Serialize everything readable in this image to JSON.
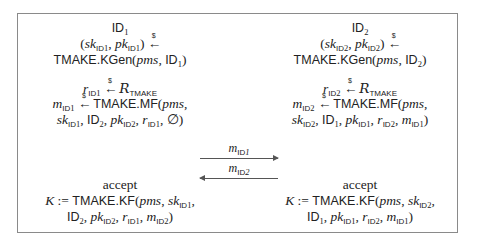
{
  "diagram": {
    "type": "protocol-flow",
    "parties": [
      {
        "id": "ID1",
        "title": "ID₁",
        "keygen": [
          "(sk_ID₁, pk_ID₁) ←$",
          "TMAKE.KGen(pms, ID₁)"
        ],
        "randomness": "r_ID₁ ←$ R_TMAKE",
        "message_gen": [
          "m_ID₁ ←$ TMAKE.MF(pms,",
          "sk_ID₁, ID₂, pk_ID₂, r_ID₁, ∅)"
        ],
        "accept_label": "accept",
        "key_derivation": [
          "K := TMAKE.KF(pms, sk_ID₁,",
          "ID₂, pk_ID₂, r_ID₁, m_ID₂)"
        ]
      },
      {
        "id": "ID2",
        "title": "ID₂",
        "keygen": [
          "(sk_ID₂, pk_ID₂) ←$",
          "TMAKE.KGen(pms, ID₂)"
        ],
        "randomness": "r_ID₂ ←$ R_TMAKE",
        "message_gen": [
          "m_ID₂ ←$ TMAKE.MF(pms,",
          "sk_ID₂, ID₁, pk_ID₁, r_ID₂, m_ID₁)"
        ],
        "accept_label": "accept",
        "key_derivation": [
          "K := TMAKE.KF(pms, sk_ID₂,",
          "ID₁, pk_ID₁, r_ID₂, m_ID₁)"
        ]
      }
    ],
    "messages": [
      {
        "label": "m_ID₁",
        "direction": "right"
      },
      {
        "label": "m_ID₂",
        "direction": "left"
      }
    ],
    "strings": {
      "id_word": "ID",
      "tmake": "TMAKE",
      "kgen": "TMAKE.KGen",
      "mf": "TMAKE.MF",
      "kf": "TMAKE.KF",
      "pms": "pms",
      "sk": "sk",
      "pk": "pk",
      "r": "r",
      "m": "m",
      "K": "K",
      "assign": ":=",
      "sample_symbol": "$",
      "empty": "∅",
      "accept": "accept",
      "calR": "R",
      "one": "1",
      "two": "2"
    }
  }
}
